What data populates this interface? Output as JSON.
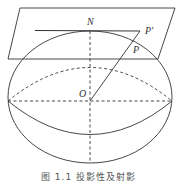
{
  "figure": {
    "labels": {
      "north_pole": "N",
      "center": "O",
      "point_on_sphere": "P",
      "projected_point": "P'"
    },
    "caption": "图 1.1  投影性及射影"
  },
  "colors": {
    "stroke": "#333333",
    "background": "#ffffff"
  }
}
